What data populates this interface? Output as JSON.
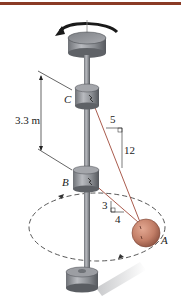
{
  "figure": {
    "colors": {
      "top_bar": "#8a3b26",
      "shaft": "#8d8f94",
      "collar": "#9a9ca1",
      "cord": "#a04a3a",
      "ball": "#c98872",
      "dimension": "#222222"
    },
    "labels": {
      "collar_top": "C",
      "collar_bottom": "B",
      "ball": "A",
      "distance": "3.3 m",
      "slope_upper_run": "5",
      "slope_upper_rise": "12",
      "slope_lower_rise": "3",
      "slope_lower_run": "4"
    },
    "icons": {
      "rotation": "rotation-arrow-icon",
      "circular_path": "dashed-circular-path"
    }
  }
}
